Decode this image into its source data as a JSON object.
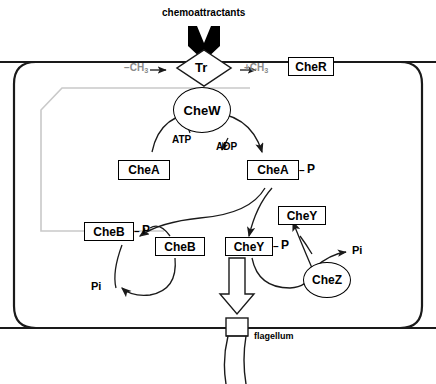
{
  "diagram": {
    "outside_label": "chemoattractants",
    "flagellum_label": "flagellum",
    "receptor_label": "Tr",
    "colors": {
      "stroke": "#1a1a1a",
      "faint": "#c9c9c9",
      "gray_text": "#8a8a8a",
      "background": "#ffffff"
    }
  },
  "nodes": {
    "receptor": "Tr",
    "chew": "CheW",
    "cher": "CheR",
    "chea": "CheA",
    "chea_p": "CheA",
    "cheb": "CheB",
    "cheb_p": "CheB",
    "chey": "CheY",
    "chey_p": "CheY",
    "chez": "CheZ"
  },
  "annotations": {
    "minus_ch3": "−CH",
    "minus_ch3_sub": "3",
    "plus_ch3": "+CH",
    "plus_ch3_sub": "3",
    "atp": "ATP",
    "adp": "ADP",
    "phosphate_left": "P",
    "phosphate_cheb": "P",
    "phosphate_chey": "P",
    "pi_left": "Pi",
    "pi_right": "Pi"
  }
}
